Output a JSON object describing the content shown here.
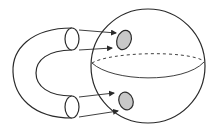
{
  "diagram": {
    "colors": {
      "stroke": "#2a2a2a",
      "disk_fill": "#c8c8c8",
      "background": "#ffffff"
    },
    "sphere": {
      "cx": 148,
      "cy": 66,
      "r": 57
    },
    "disks": [
      {
        "id": "top",
        "cx": 124,
        "cy": 40,
        "rx": 7,
        "ry": 10,
        "rotate": 20
      },
      {
        "id": "bottom",
        "cx": 126,
        "cy": 101,
        "rx": 7,
        "ry": 9,
        "rotate": -20
      }
    ],
    "tube_ends": [
      {
        "id": "top",
        "cx": 72,
        "cy": 39,
        "rx": 7,
        "ry": 11
      },
      {
        "id": "bottom",
        "cx": 72,
        "cy": 107,
        "rx": 7,
        "ry": 11
      }
    ],
    "arrows": [
      {
        "from": [
          78,
          30
        ],
        "to": [
          116,
          33
        ]
      },
      {
        "from": [
          78,
          50
        ],
        "to": [
          113,
          48
        ]
      },
      {
        "from": [
          78,
          97
        ],
        "to": [
          115,
          93
        ]
      },
      {
        "from": [
          78,
          117
        ],
        "to": [
          119,
          111
        ]
      }
    ]
  }
}
